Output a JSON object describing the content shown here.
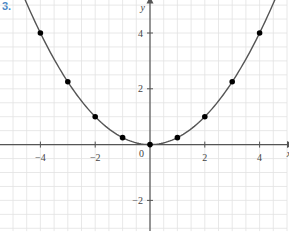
{
  "problem_label": "3.",
  "chart_data": {
    "type": "line",
    "title": "",
    "function": "y = x^2/4",
    "xlabel": "x",
    "ylabel": "y",
    "xlim": [
      -5.5,
      5.0
    ],
    "ylim": [
      -3.1,
      5.2
    ],
    "grid": true,
    "grid_step": 0.5,
    "x_ticks": [
      -4,
      -2,
      2,
      4
    ],
    "x_tick_labels": [
      "−4",
      "−2",
      "2",
      "4"
    ],
    "y_ticks": [
      4,
      2,
      -2
    ],
    "y_tick_labels": [
      "4",
      "2",
      "−2"
    ],
    "origin_label": "0",
    "series": [
      {
        "name": "plotted points",
        "x": [
          -4,
          -3,
          -2,
          -1,
          0,
          1,
          2,
          3,
          4
        ],
        "y": [
          4,
          2.25,
          1,
          0.25,
          0,
          0.25,
          1,
          2.25,
          4
        ]
      }
    ],
    "curve_color": "#555555",
    "point_color": "#000000",
    "grid_color": "#e2e2e2",
    "arrows_on_curve": true
  }
}
